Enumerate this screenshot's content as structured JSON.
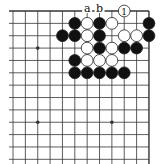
{
  "diagram": {
    "type": "go-board-fragment",
    "grid": {
      "columns": 12,
      "rows": 13,
      "origin_x": 13,
      "origin_y": 11,
      "spacing": 12.36,
      "top_edge": true,
      "right_edge": true
    },
    "star_points": [
      [
        2,
        3
      ],
      [
        2,
        9
      ],
      [
        8,
        9
      ]
    ],
    "stones": [
      {
        "col": 9,
        "row": 0,
        "color": "white",
        "label": "1"
      },
      {
        "col": 5,
        "row": 1,
        "color": "black"
      },
      {
        "col": 6,
        "row": 1,
        "color": "white"
      },
      {
        "col": 7,
        "row": 1,
        "color": "black"
      },
      {
        "col": 8,
        "row": 1,
        "color": "white"
      },
      {
        "col": 11,
        "row": 1,
        "color": "black"
      },
      {
        "col": 4,
        "row": 2,
        "color": "black"
      },
      {
        "col": 5,
        "row": 2,
        "color": "black"
      },
      {
        "col": 6,
        "row": 2,
        "color": "white"
      },
      {
        "col": 7,
        "row": 2,
        "color": "black"
      },
      {
        "col": 9,
        "row": 2,
        "color": "white"
      },
      {
        "col": 10,
        "row": 2,
        "color": "white"
      },
      {
        "col": 11,
        "row": 2,
        "color": "black"
      },
      {
        "col": 6,
        "row": 3,
        "color": "white"
      },
      {
        "col": 7,
        "row": 3,
        "color": "black"
      },
      {
        "col": 8,
        "row": 3,
        "color": "white"
      },
      {
        "col": 9,
        "row": 3,
        "color": "black"
      },
      {
        "col": 10,
        "row": 3,
        "color": "black"
      },
      {
        "col": 5,
        "row": 4,
        "color": "black"
      },
      {
        "col": 6,
        "row": 4,
        "color": "white"
      },
      {
        "col": 7,
        "row": 4,
        "color": "white"
      },
      {
        "col": 8,
        "row": 4,
        "color": "white"
      },
      {
        "col": 5,
        "row": 5,
        "color": "black"
      },
      {
        "col": 6,
        "row": 5,
        "color": "black"
      },
      {
        "col": 7,
        "row": 5,
        "color": "black"
      },
      {
        "col": 8,
        "row": 5,
        "color": "black"
      },
      {
        "col": 9,
        "row": 5,
        "color": "black"
      }
    ],
    "point_labels": [
      {
        "col": 6,
        "row": 0,
        "text": "a"
      },
      {
        "col": 7,
        "row": 0,
        "text": "b"
      }
    ],
    "colors": {
      "line": "#333333",
      "black_stone": "#111111",
      "white_stone": "#ffffff",
      "stone_outline": "#222222"
    }
  }
}
